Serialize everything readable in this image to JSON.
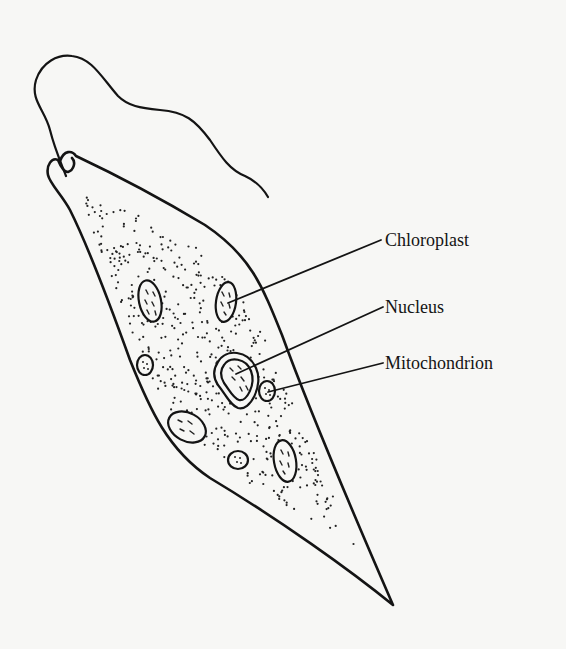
{
  "figure": {
    "colors": {
      "ink": "#141414",
      "background": "#f7f7f5"
    },
    "labels": [
      {
        "id": "chloroplast",
        "text": "Chloroplast",
        "x": 385,
        "y": 231,
        "line": [
          228,
          303,
          381,
          240
        ]
      },
      {
        "id": "nucleus",
        "text": "Nucleus",
        "x": 385,
        "y": 298,
        "line": [
          225,
          375,
          383,
          307
        ]
      },
      {
        "id": "mitochondrion",
        "text": "Mitochondrion",
        "x": 385,
        "y": 354,
        "line": [
          268,
          392,
          383,
          363
        ]
      }
    ]
  }
}
